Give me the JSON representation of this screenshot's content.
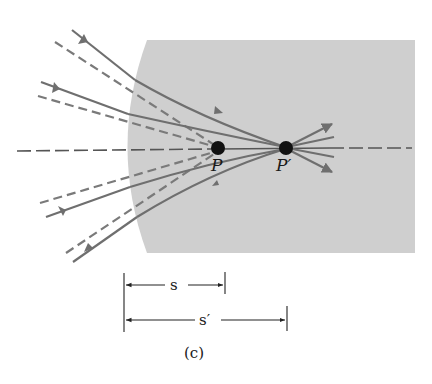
{
  "figure": {
    "caption": "(c)",
    "point_object_label": "P",
    "point_image_label": "P′",
    "distance_object_label": "s",
    "distance_image_label": "s′"
  },
  "colors": {
    "medium": "#cfcfcf",
    "ray": "#6f6f6f",
    "dashed_extension": "#7a7a7a",
    "axis": "#555555",
    "point": "#111111",
    "dimension_line": "#333333"
  }
}
